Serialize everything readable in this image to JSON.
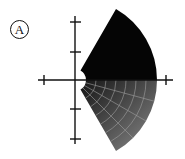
{
  "panel": {
    "label": "A"
  },
  "diagram": {
    "type": "polar-region",
    "origin": [
      75,
      80
    ],
    "inner_radius": 11,
    "outer_radius": 82,
    "theta_start_deg": -60,
    "theta_end_deg": 60,
    "upper_fill": "#050505",
    "lower_fill_gradient": [
      "#1a1a1a",
      "#7a7a7a"
    ],
    "grid_color": "#9a9a9a",
    "axis_color": "#111111",
    "x_ticks": [
      44,
      166
    ],
    "y_ticks": [
      22,
      52,
      109,
      139
    ]
  }
}
